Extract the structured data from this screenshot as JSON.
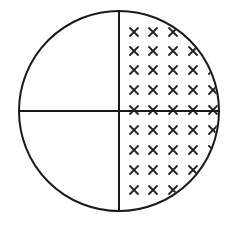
{
  "diagram": {
    "circle": {
      "cx": 119,
      "cy": 111,
      "r": 100,
      "stroke": "#1a1a1a",
      "stroke_width": 2
    },
    "dividers": {
      "vertical": {
        "x": 119,
        "y1": 11,
        "y2": 211
      },
      "horizontal": {
        "y": 111,
        "x1": 19,
        "x2": 219
      }
    },
    "shaded_region": "right-half",
    "pattern": {
      "glyph": "x-mark",
      "color": "#222222",
      "columns_x": [
        134,
        153,
        173,
        193,
        213
      ],
      "rows_y": [
        32,
        51,
        70,
        90,
        110,
        130,
        150,
        170,
        190
      ],
      "mark_half_size": 4
    },
    "quadrants": [
      {
        "id": "top-left",
        "shaded": false
      },
      {
        "id": "top-right",
        "shaded": true
      },
      {
        "id": "bottom-left",
        "shaded": false
      },
      {
        "id": "bottom-right",
        "shaded": true
      }
    ],
    "shaded_fraction": "1/2"
  }
}
